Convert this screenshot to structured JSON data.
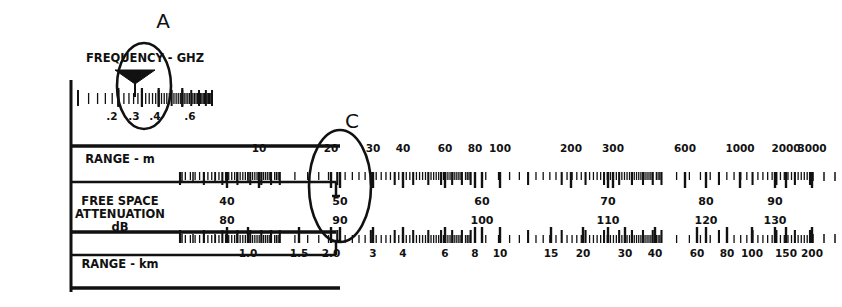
{
  "figure": {
    "kind": "nomograph",
    "background": "#ffffff",
    "ink": "#111111",
    "width": 842,
    "height": 307
  },
  "annotations": [
    {
      "name": "callout-a",
      "text": "A",
      "x": 163,
      "y": 28
    },
    {
      "name": "callout-c",
      "text": "C",
      "x": 352,
      "y": 128
    }
  ],
  "ellipses": [
    {
      "name": "ellipse-a",
      "cx": 144,
      "cy": 86,
      "rx": 27,
      "ry": 43
    },
    {
      "name": "ellipse-c",
      "cx": 340,
      "cy": 186,
      "rx": 31,
      "ry": 56
    }
  ],
  "cursor": {
    "name": "frequency-cursor",
    "label": "bow-tie-marker",
    "x": 135,
    "value": "0.3"
  },
  "row_labels": [
    {
      "name": "label-frequency",
      "lines": [
        "FREQUENCY - GHZ"
      ],
      "x": 145,
      "y": 62
    },
    {
      "name": "label-range-m",
      "lines": [
        "RANGE - m"
      ],
      "x": 120,
      "y": 163
    },
    {
      "name": "label-free-space-attenuation",
      "lines": [
        "FREE SPACE",
        "ATTENUATION",
        "dB"
      ],
      "x": 120,
      "y": 205
    },
    {
      "name": "label-range-km",
      "lines": [
        "RANGE - km"
      ],
      "x": 120,
      "y": 268
    }
  ],
  "chart_data": {
    "type": "table",
    "xlabel": "",
    "ylabel": "",
    "scales": [
      {
        "name": "frequency-scale",
        "label": "FREQUENCY - GHZ",
        "unit": "GHz",
        "axis": "log",
        "x_start": 78,
        "x_end": 212,
        "y": 101,
        "domain": [
          0.1,
          1.0
        ],
        "labeled_ticks": [
          {
            "value": 0.2,
            "text": ".2",
            "x": 112
          },
          {
            "value": 0.3,
            "text": ".3",
            "x": 134
          },
          {
            "value": 0.4,
            "text": ".4",
            "x": 155
          },
          {
            "value": 0.6,
            "text": ".6",
            "x": 190
          }
        ]
      },
      {
        "name": "range-m-scale",
        "label": "RANGE - m",
        "unit": "m",
        "axis": "log",
        "x_start": 180,
        "x_end": 810,
        "y": 172,
        "domain": [
          3,
          6000
        ],
        "labeled_ticks": [
          {
            "value": 10,
            "text": "10",
            "x": 259
          },
          {
            "value": 20,
            "text": "20",
            "x": 331
          },
          {
            "value": 30,
            "text": "30",
            "x": 373
          },
          {
            "value": 40,
            "text": "40",
            "x": 403
          },
          {
            "value": 60,
            "text": "60",
            "x": 445
          },
          {
            "value": 80,
            "text": "80",
            "x": 475
          },
          {
            "value": 100,
            "text": "100",
            "x": 500
          },
          {
            "value": 200,
            "text": "200",
            "x": 571
          },
          {
            "value": 300,
            "text": "300",
            "x": 613
          },
          {
            "value": 600,
            "text": "600",
            "x": 685
          },
          {
            "value": 1000,
            "text": "1000",
            "x": 740
          },
          {
            "value": 2000,
            "text": "2000",
            "x": 786
          },
          {
            "value": 3000,
            "text": "3000",
            "x": 812
          }
        ]
      },
      {
        "name": "attenuation-db-upper",
        "label": "FREE SPACE ATTENUATION dB",
        "unit": "dB",
        "axis": "linear",
        "y": 205,
        "labeled_ticks": [
          {
            "value": 40,
            "text": "40",
            "x": 227
          },
          {
            "value": 50,
            "text": "50",
            "x": 340
          },
          {
            "value": 60,
            "text": "60",
            "x": 482
          },
          {
            "value": 70,
            "text": "70",
            "x": 608
          },
          {
            "value": 80,
            "text": "80",
            "x": 706
          },
          {
            "value": 90,
            "text": "90",
            "x": 775
          }
        ]
      },
      {
        "name": "attenuation-db-lower",
        "label": "FREE SPACE ATTENUATION dB",
        "unit": "dB",
        "axis": "linear",
        "y": 224,
        "labeled_ticks": [
          {
            "value": 80,
            "text": "80",
            "x": 227
          },
          {
            "value": 90,
            "text": "90",
            "x": 340
          },
          {
            "value": 100,
            "text": "100",
            "x": 482
          },
          {
            "value": 110,
            "text": "110",
            "x": 608
          },
          {
            "value": 120,
            "text": "120",
            "x": 706
          },
          {
            "value": 130,
            "text": "130",
            "x": 775
          }
        ]
      },
      {
        "name": "range-km-scale",
        "label": "RANGE - km",
        "unit": "km",
        "axis": "log",
        "x_start": 180,
        "x_end": 810,
        "y": 243,
        "domain": [
          0.3,
          600
        ],
        "labeled_ticks": [
          {
            "value": 1.0,
            "text": "1.0",
            "x": 248
          },
          {
            "value": 1.5,
            "text": "1.5",
            "x": 299
          },
          {
            "value": 2.0,
            "text": "2.0",
            "x": 331
          },
          {
            "value": 3,
            "text": "3",
            "x": 373
          },
          {
            "value": 4,
            "text": "4",
            "x": 403
          },
          {
            "value": 6,
            "text": "6",
            "x": 445
          },
          {
            "value": 8,
            "text": "8",
            "x": 475
          },
          {
            "value": 10,
            "text": "10",
            "x": 500
          },
          {
            "value": 15,
            "text": "15",
            "x": 551
          },
          {
            "value": 20,
            "text": "20",
            "x": 583
          },
          {
            "value": 30,
            "text": "30",
            "x": 625
          },
          {
            "value": 40,
            "text": "40",
            "x": 655
          },
          {
            "value": 60,
            "text": "60",
            "x": 697
          },
          {
            "value": 80,
            "text": "80",
            "x": 727
          },
          {
            "value": 100,
            "text": "100",
            "x": 752
          },
          {
            "value": 150,
            "text": "150",
            "x": 786
          },
          {
            "value": 200,
            "text": "200",
            "x": 812
          }
        ]
      }
    ]
  }
}
